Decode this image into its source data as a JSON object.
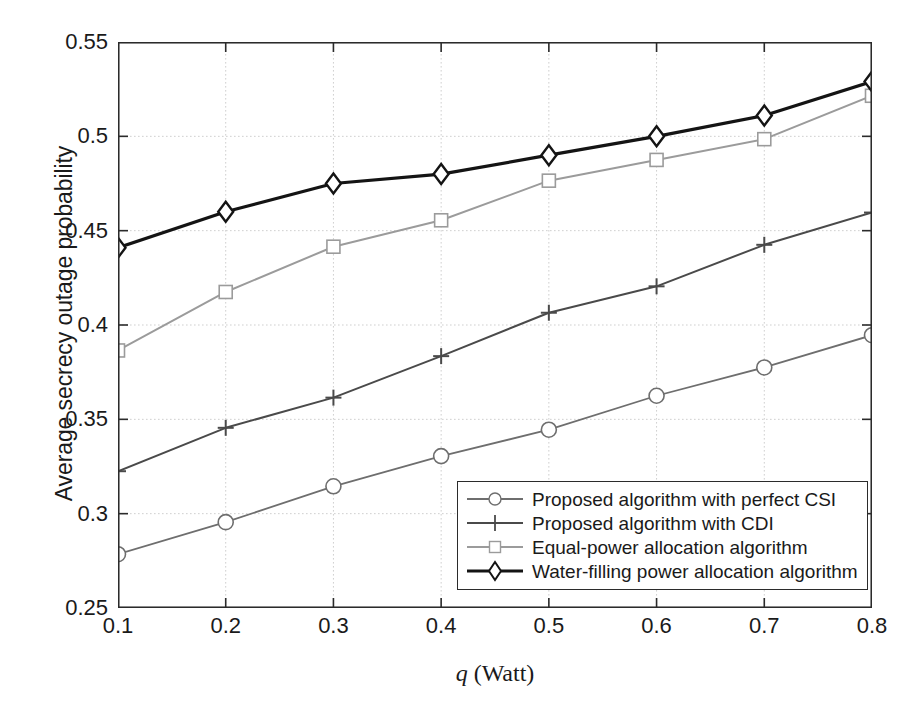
{
  "chart_data": {
    "type": "line",
    "title": "",
    "xlabel": "q (Watt)",
    "xlabel_var": "q",
    "xlabel_unit": "(Watt)",
    "ylabel": "Average secrecy outage probability",
    "x": [
      0.1,
      0.2,
      0.3,
      0.4,
      0.5,
      0.6,
      0.7,
      0.8
    ],
    "xlim": [
      0.1,
      0.8
    ],
    "ylim": [
      0.25,
      0.55
    ],
    "xticks": [
      "0.1",
      "0.2",
      "0.3",
      "0.4",
      "0.5",
      "0.6",
      "0.7",
      "0.8"
    ],
    "yticks": [
      "0.25",
      "0.3",
      "0.35",
      "0.4",
      "0.45",
      "0.5",
      "0.55"
    ],
    "grid": true,
    "legend_position": "lower right",
    "series": [
      {
        "name": "Proposed algorithm with perfect CSI",
        "marker": "circle",
        "color": "#6e6e6e",
        "linewidth": 1.8,
        "values": [
          0.2785,
          0.2955,
          0.3145,
          0.3305,
          0.3445,
          0.3625,
          0.3775,
          0.3946
        ]
      },
      {
        "name": "Proposed algorithm with CDI",
        "marker": "plus",
        "color": "#4a4a4a",
        "linewidth": 2.0,
        "values": [
          0.3225,
          0.3455,
          0.3615,
          0.3835,
          0.4065,
          0.4205,
          0.4425,
          0.4596
        ]
      },
      {
        "name": "Equal-power allocation algorithm",
        "marker": "square",
        "color": "#9b9b9b",
        "linewidth": 2.0,
        "values": [
          0.3865,
          0.4175,
          0.4415,
          0.4555,
          0.4765,
          0.4875,
          0.4985,
          0.5215
        ]
      },
      {
        "name": "Water-filling power allocation algorithm",
        "marker": "diamond",
        "color": "#141414",
        "linewidth": 3.2,
        "values": [
          0.441,
          0.46,
          0.475,
          0.48,
          0.49,
          0.5,
          0.511,
          0.529
        ]
      }
    ],
    "colors": {
      "axis": "#2b2b2b",
      "grid": "#cfcfcf",
      "background": "#ffffff",
      "text": "#1a1a1a"
    }
  }
}
